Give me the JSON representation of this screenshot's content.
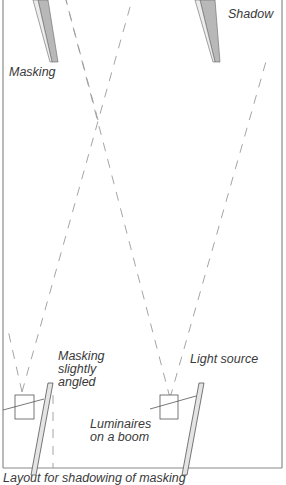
{
  "labels": {
    "masking_top": "Masking",
    "shadow": "Shadow",
    "masking_angled": "Masking\nslightly\nangled",
    "light_source": "Light source",
    "luminaires": "Luminaires\non a boom"
  },
  "caption": "Layout for shadowing of masking",
  "colors": {
    "frame": "#8a8a8a",
    "dash": "#9a9a9a",
    "masking_fill": "#e4e4e4",
    "shadow_fill": "#b8b8b8",
    "outline": "#555555",
    "text": "#3a3a3a"
  }
}
